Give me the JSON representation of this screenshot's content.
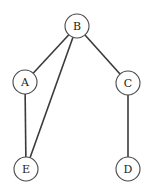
{
  "diagram": {
    "type": "tree-graph",
    "node_radius": 12,
    "colors": {
      "background": "#ffffff",
      "edge": "#3a3a3a",
      "node_stroke": "#4a4a4a",
      "label": "#222222"
    },
    "nodes": [
      {
        "id": "B",
        "label": "B",
        "x": 77,
        "y": 26
      },
      {
        "id": "A",
        "label": "A",
        "x": 25,
        "y": 82
      },
      {
        "id": "C",
        "label": "C",
        "x": 128,
        "y": 83
      },
      {
        "id": "E",
        "label": "E",
        "x": 26,
        "y": 169
      },
      {
        "id": "D",
        "label": "D",
        "x": 128,
        "y": 169
      }
    ],
    "edges": [
      {
        "from": "B",
        "to": "A"
      },
      {
        "from": "B",
        "to": "E"
      },
      {
        "from": "B",
        "to": "C"
      },
      {
        "from": "A",
        "to": "E"
      },
      {
        "from": "C",
        "to": "D"
      }
    ]
  }
}
